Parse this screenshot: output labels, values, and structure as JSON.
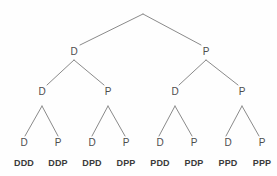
{
  "diagram": {
    "type": "binary-tree",
    "depth": 3,
    "branch_labels": [
      "D",
      "P"
    ],
    "colors": {
      "background": "#fefefe",
      "edge": "#8a8a8a",
      "node_text": "#4d4d4d",
      "outcome_text": "#3a3a3a"
    },
    "root": {
      "name": "root-apex",
      "label": "",
      "x": 143,
      "y": 14
    },
    "levels": [
      {
        "level": 1,
        "y": 52,
        "nodes": [
          {
            "id": "n-D",
            "label": "D",
            "x": 74
          },
          {
            "id": "n-P",
            "label": "P",
            "x": 206
          }
        ]
      },
      {
        "level": 2,
        "y": 92,
        "nodes": [
          {
            "id": "n-DD",
            "label": "D",
            "x": 42
          },
          {
            "id": "n-DP",
            "label": "P",
            "x": 108
          },
          {
            "id": "n-PD",
            "label": "D",
            "x": 175
          },
          {
            "id": "n-PP",
            "label": "P",
            "x": 242
          }
        ]
      },
      {
        "level": 3,
        "y": 143,
        "nodes": [
          {
            "id": "n-DDD",
            "label": "D",
            "x": 24
          },
          {
            "id": "n-DDP",
            "label": "P",
            "x": 58
          },
          {
            "id": "n-DPD",
            "label": "D",
            "x": 92
          },
          {
            "id": "n-DPP",
            "label": "P",
            "x": 126
          },
          {
            "id": "n-PDD",
            "label": "D",
            "x": 160
          },
          {
            "id": "n-PDP",
            "label": "P",
            "x": 194
          },
          {
            "id": "n-PPD",
            "label": "D",
            "x": 228
          },
          {
            "id": "n-PPP",
            "label": "P",
            "x": 262
          }
        ]
      }
    ],
    "outcomes": {
      "y": 163,
      "items": [
        {
          "id": "o-DDD",
          "label": "DDD",
          "x": 24
        },
        {
          "id": "o-DDP",
          "label": "DDP",
          "x": 58
        },
        {
          "id": "o-DPD",
          "label": "DPD",
          "x": 92
        },
        {
          "id": "o-DPP",
          "label": "DPP",
          "x": 126
        },
        {
          "id": "o-PDD",
          "label": "PDD",
          "x": 160
        },
        {
          "id": "o-PDP",
          "label": "PDP",
          "x": 194
        },
        {
          "id": "o-PPD",
          "label": "PPD",
          "x": 228
        },
        {
          "id": "o-PPP",
          "label": "PPP",
          "x": 262
        }
      ]
    },
    "edges": [
      {
        "id": "e-root-D",
        "from": "root",
        "to": "n-D",
        "x1": 143,
        "y1": 14,
        "x2": 80,
        "y2": 45
      },
      {
        "id": "e-root-P",
        "from": "root",
        "to": "n-P",
        "x1": 143,
        "y1": 14,
        "x2": 201,
        "y2": 45
      },
      {
        "id": "e-D-DD",
        "from": "n-D",
        "to": "n-DD",
        "x1": 74,
        "y1": 60,
        "x2": 47,
        "y2": 85
      },
      {
        "id": "e-D-DP",
        "from": "n-D",
        "to": "n-DP",
        "x1": 74,
        "y1": 60,
        "x2": 104,
        "y2": 85
      },
      {
        "id": "e-P-PD",
        "from": "n-P",
        "to": "n-PD",
        "x1": 206,
        "y1": 60,
        "x2": 179,
        "y2": 85
      },
      {
        "id": "e-P-PP",
        "from": "n-P",
        "to": "n-PP",
        "x1": 206,
        "y1": 60,
        "x2": 238,
        "y2": 85
      },
      {
        "id": "e-DD-DDD",
        "from": "n-DD",
        "to": "n-DDD",
        "x1": 42,
        "y1": 106,
        "x2": 25,
        "y2": 136
      },
      {
        "id": "e-DD-DDP",
        "from": "n-DD",
        "to": "n-DDP",
        "x1": 42,
        "y1": 106,
        "x2": 58,
        "y2": 136
      },
      {
        "id": "e-DP-DPD",
        "from": "n-DP",
        "to": "n-DPD",
        "x1": 108,
        "y1": 106,
        "x2": 92,
        "y2": 136
      },
      {
        "id": "e-DP-DPP",
        "from": "n-DP",
        "to": "n-DPP",
        "x1": 108,
        "y1": 106,
        "x2": 125,
        "y2": 136
      },
      {
        "id": "e-PD-PDD",
        "from": "n-PD",
        "to": "n-PDD",
        "x1": 175,
        "y1": 106,
        "x2": 159,
        "y2": 136
      },
      {
        "id": "e-PD-PDP",
        "from": "n-PD",
        "to": "n-PDP",
        "x1": 175,
        "y1": 106,
        "x2": 192,
        "y2": 136
      },
      {
        "id": "e-PP-PPD",
        "from": "n-PP",
        "to": "n-PPD",
        "x1": 242,
        "y1": 106,
        "x2": 226,
        "y2": 136
      },
      {
        "id": "e-PP-PPP",
        "from": "n-PP",
        "to": "n-PPP",
        "x1": 242,
        "y1": 106,
        "x2": 259,
        "y2": 136
      }
    ]
  }
}
